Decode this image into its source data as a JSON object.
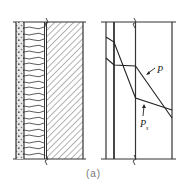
{
  "figure": {
    "caption": "(a)",
    "left_panel": {
      "description": "wall cross-section with insulation layers",
      "layers": [
        "plaster (dotted)",
        "fibrous insulation",
        "masonry (hatched)"
      ]
    },
    "right_panel": {
      "description": "vapor pressure distribution across wall layers",
      "labels": {
        "p": "P",
        "ps": "P",
        "ps_subscript": "s"
      }
    },
    "colors": {
      "line": "#2a2a2a",
      "caption": "#777777"
    }
  }
}
